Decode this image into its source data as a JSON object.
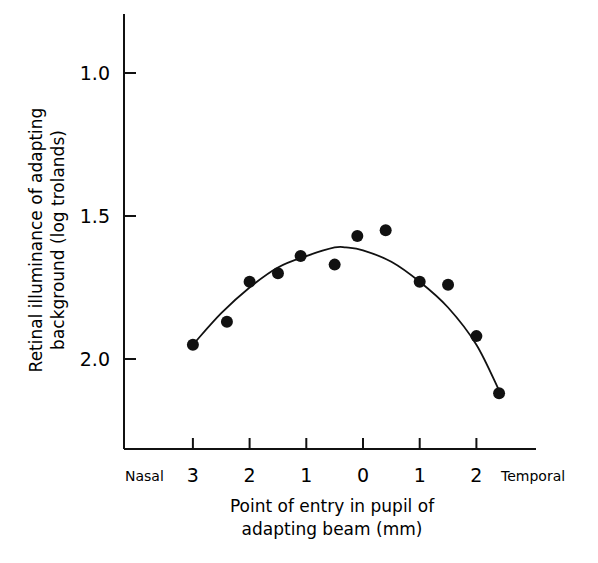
{
  "chart_data": {
    "type": "scatter",
    "title": "",
    "xlabel": "Point of entry in pupil of adapting beam (mm)",
    "xlabel_lines": [
      "Point of entry in pupil of",
      "adapting beam (mm)"
    ],
    "ylabel": "Retinal illuminance of adapting background (log trolands)",
    "ylabel_lines": [
      "Retinal illuminance of adapting",
      "background (log trolands)"
    ],
    "x_side_labels": {
      "left": "Nasal",
      "right": "Temporal"
    },
    "x_ticks": [
      "3",
      "2",
      "1",
      "0",
      "1",
      "2"
    ],
    "x_tick_positions_mm": [
      3,
      2,
      1,
      0,
      -1,
      -2
    ],
    "y_ticks": [
      "1.0",
      "1.5",
      "2.0"
    ],
    "y_tick_values": [
      1.0,
      1.5,
      2.0
    ],
    "ylim": [
      2.3,
      0.85
    ],
    "y_inverted": true,
    "x_convention": "positive = nasal, negative = temporal",
    "grid": false,
    "legend": null,
    "series": [
      {
        "name": "data",
        "type": "scatter",
        "x": [
          3.0,
          2.4,
          2.0,
          1.5,
          1.1,
          0.5,
          0.1,
          -0.4,
          -1.0,
          -1.5,
          -2.0,
          -2.4
        ],
        "y": [
          1.95,
          1.87,
          1.73,
          1.7,
          1.64,
          1.67,
          1.57,
          1.55,
          1.73,
          1.74,
          1.92,
          2.12
        ]
      },
      {
        "name": "fitted curve",
        "type": "line",
        "x": [
          3.0,
          2.5,
          2.0,
          1.5,
          1.0,
          0.5,
          0.3,
          0.0,
          -0.5,
          -1.0,
          -1.5,
          -2.0,
          -2.4
        ],
        "y": [
          1.95,
          1.84,
          1.75,
          1.68,
          1.64,
          1.61,
          1.61,
          1.62,
          1.66,
          1.73,
          1.82,
          1.95,
          2.11
        ]
      }
    ]
  }
}
